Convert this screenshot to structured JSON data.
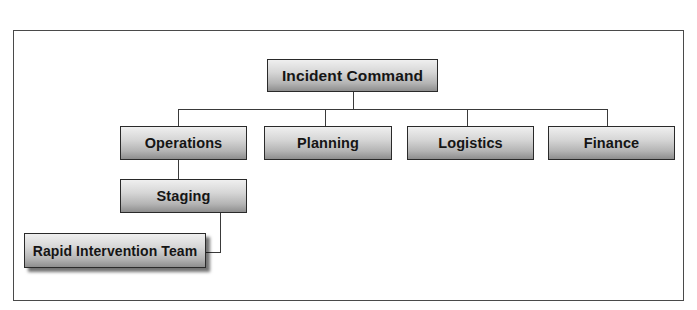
{
  "diagram": {
    "type": "org-chart",
    "title": "Incident Command",
    "nodes": {
      "root": {
        "label": "Incident Command"
      },
      "operations": {
        "label": "Operations"
      },
      "planning": {
        "label": "Planning"
      },
      "logistics": {
        "label": "Logistics"
      },
      "finance": {
        "label": "Finance"
      },
      "staging": {
        "label": "Staging"
      },
      "rit": {
        "label": "Rapid Intervention Team"
      }
    },
    "edges": [
      [
        "Incident Command",
        "Operations"
      ],
      [
        "Incident Command",
        "Planning"
      ],
      [
        "Incident Command",
        "Logistics"
      ],
      [
        "Incident Command",
        "Finance"
      ],
      [
        "Operations",
        "Staging"
      ],
      [
        "Staging",
        "Rapid Intervention Team"
      ]
    ],
    "colors": {
      "border": "#2a2a2a",
      "box_top": "#efefef",
      "box_bottom": "#8e8e8e",
      "text": "#151515",
      "frame": "#4a4a4a"
    }
  }
}
